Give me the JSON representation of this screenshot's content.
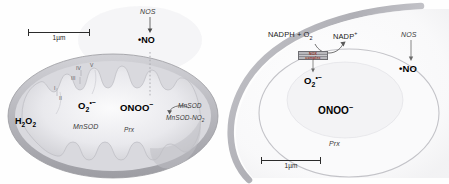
{
  "figure": {
    "panels": [
      {
        "id": "mitochondrion",
        "scalebar": {
          "label": "1µm"
        },
        "nos_pathway": {
          "enzyme": "NOS",
          "product_radical": "•",
          "product": "NO"
        },
        "etc_complexes": [
          "I",
          "II",
          "III",
          "IV",
          "V"
        ],
        "species": {
          "superoxide_main": "O",
          "superoxide_sub": "2",
          "superoxide_sup": "•−",
          "peroxynitrite": "ONOO",
          "peroxynitrite_charge": "−",
          "hydrogen_peroxide_h": "H",
          "hydrogen_peroxide_sub1": "2",
          "hydrogen_peroxide_o": "O",
          "hydrogen_peroxide_sub2": "2"
        },
        "enzymes": {
          "mnsod": "MnSOD",
          "prx": "Prx",
          "mnsod_reactant": "MnSOD",
          "mnsod_product": "MnSOD-NO",
          "mnsod_product_sub": "2"
        }
      },
      {
        "id": "cell",
        "scalebar": {
          "label": "1µm"
        },
        "nos_pathway": {
          "enzyme": "NOS",
          "product_radical": "•",
          "product": "NO"
        },
        "nox_reaction": {
          "substrate_nadph": "NADPH + O",
          "substrate_sub": "2",
          "product_nadp": "NADP",
          "product_charge": "+",
          "complex_line1": "NOX",
          "complex_line2": "complex"
        },
        "species": {
          "superoxide_main": "O",
          "superoxide_sub": "2",
          "superoxide_sup": "•−",
          "peroxynitrite": "ONOO",
          "peroxynitrite_charge": "−"
        },
        "enzymes": {
          "prx": "Prx"
        }
      }
    ],
    "colors": {
      "membrane_gray": "#b9b9bd",
      "matrix_light": "#ececef",
      "text_dark": "#1a1a1a",
      "nox_red": "#8d2b20",
      "rule_gray": "#8a8a8e"
    }
  }
}
